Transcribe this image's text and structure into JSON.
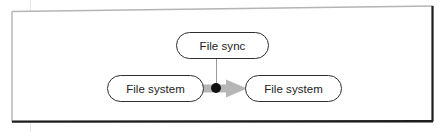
{
  "diagram": {
    "type": "uml-activity-fragment",
    "frame": {
      "border_light_color": "#b4b4b4",
      "border_dark_color": "#1d1d1d",
      "background_color": "#ffffff"
    },
    "nodes": [
      {
        "id": "file-sync",
        "label": "File sync",
        "shape": "rounded-rectangle",
        "x": 176,
        "y": 32,
        "width": 93,
        "height": 27,
        "fill": "#ffffff",
        "stroke": "#2e2e2e"
      },
      {
        "id": "file-system-source",
        "label": "File system",
        "shape": "rounded-rectangle",
        "x": 107,
        "y": 75,
        "width": 97,
        "height": 27,
        "fill": "#ffffff",
        "stroke": "#2e2e2e"
      },
      {
        "id": "file-system-target",
        "label": "File system",
        "shape": "rounded-rectangle",
        "x": 245,
        "y": 75,
        "width": 97,
        "height": 27,
        "fill": "#ffffff",
        "stroke": "#2e2e2e"
      }
    ],
    "edges": [
      {
        "id": "flow-arrow",
        "from": "file-system-source",
        "to": "file-system-target",
        "style": "thick-block-arrow",
        "color": "#b6b6b6",
        "label": ""
      },
      {
        "id": "sync-dependency",
        "from": "file-sync",
        "to": "flow-junction",
        "style": "thin-line",
        "color": "#9a9a9a",
        "label": ""
      }
    ],
    "junction": {
      "id": "flow-junction",
      "shape": "filled-circle",
      "cx": 216,
      "cy": 88,
      "r": 5,
      "color": "#111111"
    },
    "guide": {
      "id": "margin-guide",
      "color": "#e8e8e8",
      "x": 30
    }
  }
}
